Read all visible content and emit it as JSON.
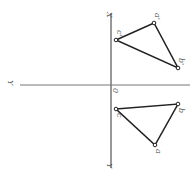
{
  "diagram": {
    "type": "orthographic projection of a triangle",
    "axes": {
      "vertical_axis_top_label": "X",
      "vertical_axis_bottom_label": "Y",
      "horizontal_axis_label": "Y",
      "origin_label": "0"
    },
    "upper_projection": {
      "points": [
        {
          "label": "c'",
          "x": 116,
          "y": 40
        },
        {
          "label": "a'",
          "x": 154,
          "y": 23
        },
        {
          "label": "b'",
          "x": 178,
          "y": 68
        }
      ]
    },
    "lower_projection": {
      "points": [
        {
          "label": "c",
          "x": 116,
          "y": 109
        },
        {
          "label": "b",
          "x": 178,
          "y": 104
        },
        {
          "label": "a",
          "x": 155,
          "y": 145
        }
      ]
    },
    "colors": {
      "line": "#222222",
      "axis": "#333333",
      "label": "#555555"
    }
  }
}
